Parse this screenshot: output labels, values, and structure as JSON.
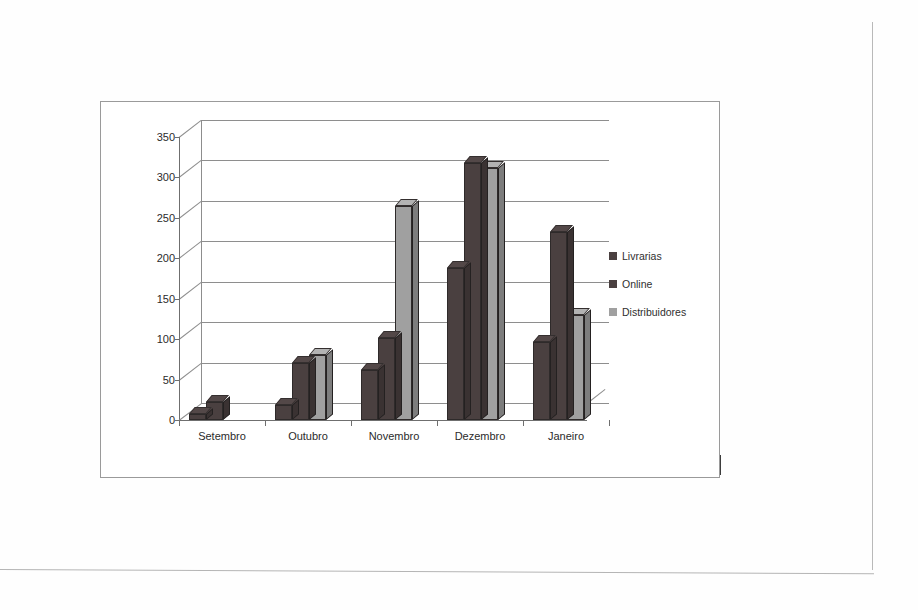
{
  "document": {
    "type": "scanned-page",
    "background_color": "#fefefe"
  },
  "chart_frame": {
    "border_color": "#9a9a9a"
  },
  "legend": {
    "position": "right",
    "entries": [
      {
        "label": "Livrarias",
        "color": "#4a4040"
      },
      {
        "label": "Online",
        "color": "#4a4040"
      },
      {
        "label": "Distribuidores",
        "color": "#a0a0a0"
      }
    ]
  },
  "axis": {
    "y_ticks": [
      "0",
      "50",
      "100",
      "150",
      "200",
      "250",
      "300",
      "350"
    ],
    "x_ticks": [
      "Setembro",
      "Outubro",
      "Novembro",
      "Dezembro",
      "Janeiro"
    ]
  },
  "chart_data": {
    "type": "bar",
    "title": "",
    "subtitle": "",
    "xlabel": "",
    "ylabel": "",
    "categories": [
      "Setembro",
      "Outubro",
      "Novembro",
      "Dezembro",
      "Janeiro"
    ],
    "series": [
      {
        "name": "Livrarias",
        "color": "#4a4040",
        "values": [
          8,
          18,
          62,
          188,
          97
        ]
      },
      {
        "name": "Online",
        "color": "#4a4040",
        "values": [
          22,
          70,
          102,
          318,
          232
        ]
      },
      {
        "name": "Distribuidores",
        "color": "#a0a0a0",
        "values": [
          0,
          80,
          265,
          312,
          130
        ]
      }
    ],
    "ylim": [
      0,
      350
    ],
    "ytick_step": 50,
    "grid": true,
    "grid_axis": "y",
    "legend_position": "right",
    "style": "3d-clustered-column"
  }
}
